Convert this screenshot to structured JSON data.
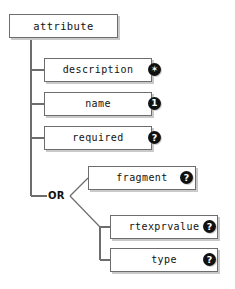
{
  "diagram": {
    "type": "xml-schema-element-tree",
    "title": "attribute",
    "root": {
      "label": "attribute",
      "name": "root-node-attribute"
    },
    "operator": {
      "label": "OR",
      "name": "or-junction"
    },
    "children": [
      {
        "label": "description",
        "badge": "✶",
        "badge_meaning": "zero-or-more",
        "badge_icon": "star-badge-icon"
      },
      {
        "label": "name",
        "badge": "1",
        "badge_meaning": "exactly-one",
        "badge_icon": "one-badge-icon"
      },
      {
        "label": "required",
        "badge": "?",
        "badge_meaning": "optional",
        "badge_icon": "question-badge-icon"
      },
      {
        "label": "fragment",
        "badge": "?",
        "badge_meaning": "optional",
        "badge_icon": "question-badge-icon"
      },
      {
        "label": "rtexprvalue",
        "badge": "?",
        "badge_meaning": "optional",
        "badge_icon": "question-badge-icon"
      },
      {
        "label": "type",
        "badge": "?",
        "badge_meaning": "optional",
        "badge_icon": "question-badge-icon"
      }
    ],
    "colors": {
      "background": "#ffffff",
      "box_border": "#6d6d6d",
      "box_fill": "#ffffff",
      "shadow": "#c9c9c9",
      "wire": "#6d6d6d",
      "text": "#121212",
      "badge_fill": "#111111",
      "badge_text": "#ffffff"
    }
  }
}
